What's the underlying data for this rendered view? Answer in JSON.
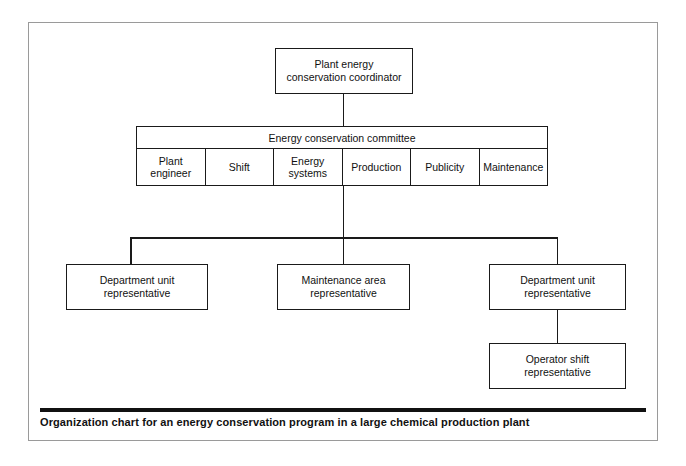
{
  "chart_data": {
    "type": "diagram",
    "diagram_kind": "organization-chart",
    "title": "Organization chart for an energy conservation program in a large chemical production plant",
    "levels": [
      {
        "level": 1,
        "nodes": [
          "Plant energy conservation coordinator"
        ]
      },
      {
        "level": 2,
        "nodes": [
          "Energy conservation committee"
        ]
      },
      {
        "level": 3,
        "nodes": [
          "Department unit representative",
          "Maintenance area representative",
          "Department unit representative"
        ]
      },
      {
        "level": 4,
        "nodes": [
          "Operator shift representative"
        ]
      }
    ],
    "edges": [
      {
        "from": "Plant energy conservation coordinator",
        "to": "Energy conservation committee"
      },
      {
        "from": "Energy conservation committee",
        "to": "Department unit representative (left)"
      },
      {
        "from": "Energy conservation committee",
        "to": "Maintenance area representative"
      },
      {
        "from": "Energy conservation committee",
        "to": "Department unit representative (right)"
      },
      {
        "from": "Department unit representative (right)",
        "to": "Operator shift representative"
      }
    ]
  },
  "root": {
    "label": "Plant energy\nconservation coordinator"
  },
  "committee": {
    "title": "Energy conservation committee",
    "columns": [
      {
        "label": "Plant\nengineer"
      },
      {
        "label": "Shift"
      },
      {
        "label": "Energy\nsystems"
      },
      {
        "label": "Production"
      },
      {
        "label": "Publicity"
      },
      {
        "label": "Maintenance"
      }
    ]
  },
  "level3": {
    "department_unit_left": "Department unit\nrepresentative",
    "maintenance_area": "Maintenance area\nrepresentative",
    "department_unit_right": "Department unit\nrepresentative"
  },
  "level4": {
    "operator_shift": "Operator shift\nrepresentative"
  },
  "caption": {
    "text": "Organization chart for an energy conservation program in a large chemical production plant"
  },
  "colors": {
    "box_border": "#1a1a1a",
    "frame_border": "#9a9a9a",
    "text": "#111111",
    "background": "#ffffff",
    "caption_rule": "#111111"
  }
}
